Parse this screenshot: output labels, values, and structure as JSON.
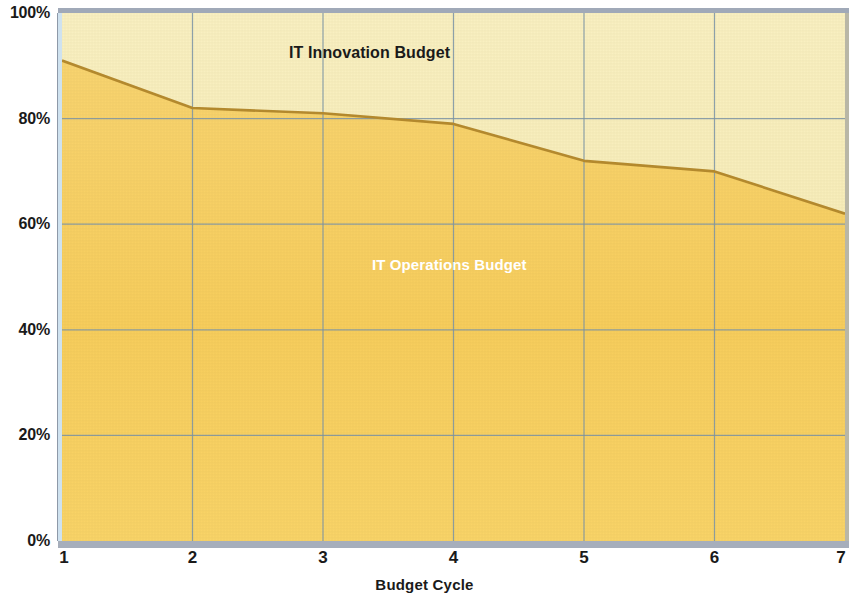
{
  "chart_data": {
    "type": "area",
    "subtype": "stacked-100-percent",
    "title": "",
    "xlabel": "Budget Cycle",
    "ylabel": "",
    "x": [
      1,
      2,
      3,
      4,
      5,
      6,
      7
    ],
    "xtick_labels": [
      "1",
      "2",
      "3",
      "4",
      "5",
      "6",
      "7"
    ],
    "ytick_labels": [
      "0%",
      "20%",
      "40%",
      "60%",
      "80%",
      "100%"
    ],
    "ytick_values": [
      0,
      20,
      40,
      60,
      80,
      100
    ],
    "ylim": [
      0,
      100
    ],
    "xlim": [
      1,
      7
    ],
    "grid": true,
    "grid_color": "#7b94a8",
    "legend_position": "inline-annotations",
    "series": [
      {
        "name": "IT Operations Budget",
        "values": [
          91,
          82,
          81,
          79,
          72,
          70,
          62
        ],
        "color": "#f6cc5e",
        "label_color": "#ffffff",
        "stack_order": "bottom"
      },
      {
        "name": "IT Innovation Budget",
        "values": [
          9,
          18,
          19,
          21,
          28,
          30,
          38
        ],
        "color": "#f7edb8",
        "label_color": "#1a1a1a",
        "stack_order": "top"
      }
    ],
    "boundary_line_color": "#b58a2e",
    "annotations": [
      {
        "text": "IT Innovation Budget",
        "x": 2.2,
        "y": 92
      },
      {
        "text": "IT Operations Budget",
        "x": 3.0,
        "y": 52
      }
    ]
  },
  "axis": {
    "y_ticks": [
      {
        "label": "100%",
        "value": 100
      },
      {
        "label": "80%",
        "value": 80
      },
      {
        "label": "60%",
        "value": 60
      },
      {
        "label": "40%",
        "value": 40
      },
      {
        "label": "20%",
        "value": 20
      },
      {
        "label": "0%",
        "value": 0
      }
    ],
    "x_ticks": [
      {
        "label": "1",
        "value": 1
      },
      {
        "label": "2",
        "value": 2
      },
      {
        "label": "3",
        "value": 3
      },
      {
        "label": "4",
        "value": 4
      },
      {
        "label": "5",
        "value": 5
      },
      {
        "label": "6",
        "value": 6
      },
      {
        "label": "7",
        "value": 7
      }
    ],
    "x_title": "Budget Cycle"
  },
  "labels": {
    "innovation": "IT Innovation Budget",
    "operations": "IT Operations Budget"
  },
  "colors": {
    "operations_fill": "#f6cc5e",
    "innovation_fill": "#f7edb8",
    "boundary_line": "#b58a2e",
    "gridline": "#7b94a8",
    "frame_top": "#a0a9b8",
    "frame_bottom": "#a6aebb",
    "frame_left": "#cfe2ef",
    "frame_right": "#b9b7a6",
    "text": "#1a1a1a"
  }
}
